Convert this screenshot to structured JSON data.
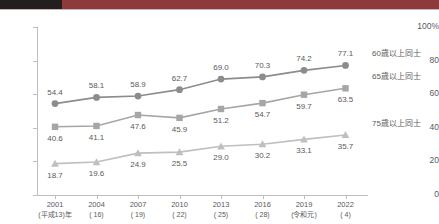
{
  "banner": {
    "left_block_color": "#231f1f",
    "bar_color": "#8c3a3a"
  },
  "chart_data": {
    "type": "line",
    "title": "",
    "xlabel": "",
    "ylabel": "",
    "ylim": [
      0,
      100
    ],
    "yticks": [
      0,
      20,
      40,
      60,
      80,
      100
    ],
    "y_unit": "%",
    "grid": false,
    "legend_position": "right",
    "categories": [
      "2001",
      "2004",
      "2007",
      "2010",
      "2013",
      "2016",
      "2019",
      "2022"
    ],
    "category_sublabels": [
      "(平成13)年",
      "( 16)",
      "( 19)",
      "( 22)",
      "( 25)",
      "( 28)",
      "(令和元)",
      "( 4)"
    ],
    "series": [
      {
        "name": "60歳以上同士",
        "marker": "circle",
        "color": "#8c8c8c",
        "values": [
          54.4,
          58.1,
          58.9,
          62.7,
          69.0,
          70.3,
          74.2,
          77.1
        ]
      },
      {
        "name": "65歳以上同士",
        "marker": "square",
        "color": "#a6a6a6",
        "values": [
          40.6,
          41.1,
          47.6,
          45.9,
          51.2,
          54.7,
          59.7,
          63.5
        ]
      },
      {
        "name": "75歳以上同士",
        "marker": "triangle",
        "color": "#bfbfbf",
        "values": [
          18.7,
          19.6,
          24.9,
          25.5,
          29.0,
          30.2,
          33.1,
          35.7
        ]
      }
    ]
  }
}
